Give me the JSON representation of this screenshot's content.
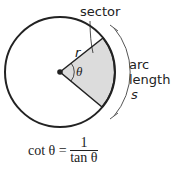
{
  "labels": {
    "sector": "sector",
    "radius": "r",
    "angle": "θ",
    "arc": "arc",
    "length": "length",
    "s": "s"
  },
  "formula": {
    "lhs": "cot θ =",
    "numerator": "1",
    "denominator": "tan θ"
  },
  "colors": {
    "sector_fill": "#dcdcdc",
    "stroke": "#222222"
  }
}
